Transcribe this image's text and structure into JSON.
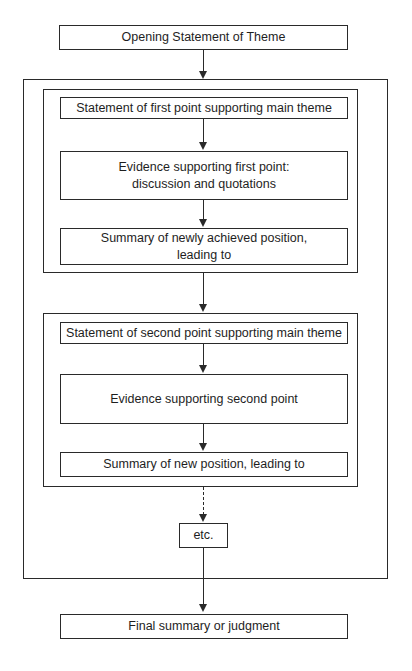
{
  "diagram": {
    "type": "flowchart",
    "header": "",
    "nodes": {
      "opening": "Opening Statement of Theme",
      "point1_statement": "Statement of first point supporting main theme",
      "point1_evidence_line1": "Evidence supporting first point:",
      "point1_evidence_line2": "discussion and quotations",
      "point1_summary_line1": "Summary of newly achieved position,",
      "point1_summary_line2": "leading to",
      "point2_statement": "Statement of second point supporting main theme",
      "point2_evidence": "Evidence supporting second point",
      "point2_summary": "Summary of new position, leading to",
      "etc": "etc.",
      "final": "Final summary or judgment"
    },
    "edges": [
      {
        "from": "opening",
        "to": "body-frame",
        "style": "solid"
      },
      {
        "from": "point1_statement",
        "to": "point1_evidence",
        "style": "solid"
      },
      {
        "from": "point1_evidence",
        "to": "point1_summary",
        "style": "solid"
      },
      {
        "from": "point1-group",
        "to": "point2-group",
        "style": "solid"
      },
      {
        "from": "point2_statement",
        "to": "point2_evidence",
        "style": "solid"
      },
      {
        "from": "point2_evidence",
        "to": "point2_summary",
        "style": "solid"
      },
      {
        "from": "point2-group",
        "to": "etc",
        "style": "dashed"
      },
      {
        "from": "etc",
        "to": "final",
        "style": "solid"
      }
    ],
    "colors": {
      "stroke": "#2a2a2a",
      "text": "#1e1e1e",
      "background": "#ffffff"
    }
  }
}
